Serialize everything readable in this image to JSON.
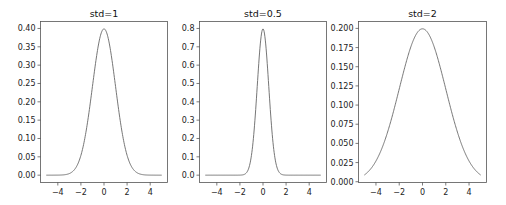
{
  "chart_data": [
    {
      "type": "line",
      "title": "std=1",
      "xlabel": "",
      "ylabel": "",
      "function": "normal_pdf",
      "mean": 0,
      "std": 1,
      "x_range": [
        -5,
        5
      ],
      "xlim": [
        -5.5,
        5.5
      ],
      "ylim": [
        -0.02,
        0.419
      ],
      "xticks": [
        -4,
        -2,
        0,
        2,
        4
      ],
      "xtick_labels": [
        "−4",
        "−2",
        "0",
        "2",
        "4"
      ],
      "yticks": [
        0.0,
        0.05,
        0.1,
        0.15,
        0.2,
        0.25,
        0.3,
        0.35,
        0.4
      ],
      "ytick_labels": [
        "0.00",
        "0.05",
        "0.10",
        "0.15",
        "0.20",
        "0.25",
        "0.30",
        "0.35",
        "0.40"
      ],
      "peak": {
        "x": 0,
        "y": 0.399
      },
      "grid": false,
      "color": "#666666"
    },
    {
      "type": "line",
      "title": "std=0.5",
      "xlabel": "",
      "ylabel": "",
      "function": "normal_pdf",
      "mean": 0,
      "std": 0.5,
      "x_range": [
        -5,
        5
      ],
      "xlim": [
        -5.5,
        5.5
      ],
      "ylim": [
        -0.04,
        0.838
      ],
      "xticks": [
        -4,
        -2,
        0,
        2,
        4
      ],
      "xtick_labels": [
        "−4",
        "−2",
        "0",
        "2",
        "4"
      ],
      "yticks": [
        0.0,
        0.1,
        0.2,
        0.3,
        0.4,
        0.5,
        0.6,
        0.7,
        0.8
      ],
      "ytick_labels": [
        "0.0",
        "0.1",
        "0.2",
        "0.3",
        "0.4",
        "0.5",
        "0.6",
        "0.7",
        "0.8"
      ],
      "peak": {
        "x": 0,
        "y": 0.798
      },
      "grid": false,
      "color": "#666666"
    },
    {
      "type": "line",
      "title": "std=2",
      "xlabel": "",
      "ylabel": "",
      "function": "normal_pdf",
      "mean": 0,
      "std": 2,
      "x_range": [
        -5,
        5
      ],
      "xlim": [
        -5.5,
        5.5
      ],
      "ylim": [
        -0.001,
        0.209
      ],
      "xticks": [
        -4,
        -2,
        0,
        2,
        4
      ],
      "xtick_labels": [
        "−4",
        "−2",
        "0",
        "2",
        "4"
      ],
      "yticks": [
        0.0,
        0.025,
        0.05,
        0.075,
        0.1,
        0.125,
        0.15,
        0.175,
        0.2
      ],
      "ytick_labels": [
        "0.000",
        "0.025",
        "0.050",
        "0.075",
        "0.100",
        "0.125",
        "0.150",
        "0.175",
        "0.200"
      ],
      "peak": {
        "x": 0,
        "y": 0.199
      },
      "grid": false,
      "color": "#666666"
    }
  ]
}
